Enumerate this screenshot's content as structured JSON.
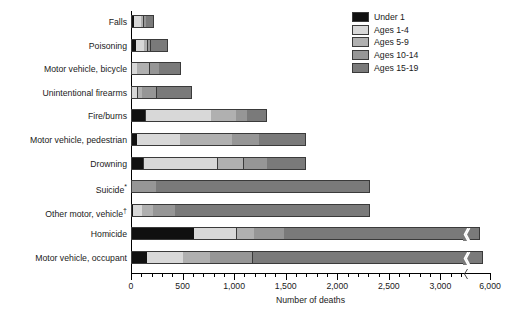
{
  "chart_data": {
    "type": "bar",
    "orientation": "horizontal",
    "stacked": true,
    "title": "",
    "xlabel": "Number of deaths",
    "ylabel": "",
    "xlim": [
      0,
      6000
    ],
    "grid": false,
    "axis_break": {
      "after": 3200,
      "to": 6000,
      "note": "x-axis is broken between 3,000 and 6,000"
    },
    "legend_position": "top-right",
    "xticks_major": [
      0,
      500,
      1000,
      1500,
      2000,
      2500,
      3000,
      6000
    ],
    "xtick_labels": [
      "0",
      "500",
      "1,000",
      "1,500",
      "2,000",
      "2,500",
      "3,000",
      "6,000"
    ],
    "xticks_minor_step": 100,
    "categories": [
      "Falls",
      "Poisoning",
      "Motor vehicle, bicycle",
      "Unintentional firearms",
      "Fire/burns",
      "Motor vehicle, pedestrian",
      "Drowning",
      "Suicide*",
      "Other motor, vehicle†",
      "Homicide",
      "Motor vehicle, occupant"
    ],
    "series": [
      {
        "name": "Under 1",
        "color": "#101010",
        "values": [
          40,
          55,
          5,
          5,
          150,
          65,
          130,
          0,
          30,
          620,
          165
        ]
      },
      {
        "name": "Ages 1-4",
        "color": "#d8d8d8",
        "values": [
          70,
          90,
          55,
          60,
          640,
          430,
          725,
          0,
          95,
          420,
          355
        ]
      },
      {
        "name": "Ages 5-9",
        "color": "#b0b0b0",
        "values": [
          35,
          40,
          130,
          50,
          250,
          510,
          260,
          0,
          110,
          175,
          270
        ]
      },
      {
        "name": "Ages 10-14",
        "color": "#969696",
        "values": [
          30,
          35,
          100,
          150,
          115,
          265,
          235,
          250,
          220,
          300,
          420
        ]
      },
      {
        "name": "Ages 15-19",
        "color": "#7a7a7a",
        "values": [
          80,
          165,
          215,
          340,
          190,
          455,
          380,
          2080,
          1890,
          3870,
          4390
        ]
      }
    ],
    "totals": [
      255,
      385,
      505,
      605,
      1345,
      1725,
      1730,
      2330,
      2345,
      5385,
      5600
    ],
    "legend_entries": [
      "Under 1",
      "Ages 1-4",
      "Ages 5-9",
      "Ages 10-14",
      "Ages 15-19"
    ]
  },
  "footnotes": {
    "suicide": "*",
    "other_motor": "†"
  }
}
